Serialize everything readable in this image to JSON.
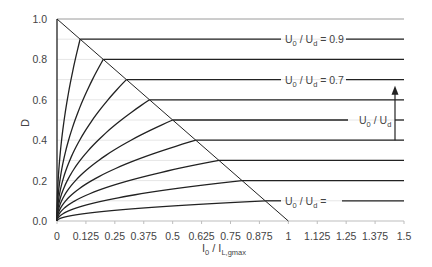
{
  "chart_data": {
    "type": "line",
    "title": "",
    "xlabel": "I0 / IL,gmax",
    "xlabel_parts": {
      "main": "I",
      "sub": "0",
      "sep": " / ",
      "main2": "I",
      "sub2": "L,gmax"
    },
    "ylabel": "D",
    "xlim": [
      0,
      1.5
    ],
    "ylim": [
      0,
      1.0
    ],
    "x_ticks": [
      "0",
      "0.125",
      "0.25",
      "0.375",
      "0.5",
      "0.625",
      "0.75",
      "0.875",
      "1",
      "1.125",
      "1.25",
      "1.375",
      "1.5"
    ],
    "x_tick_values": [
      0,
      0.125,
      0.25,
      0.375,
      0.5,
      0.625,
      0.75,
      0.875,
      1,
      1.125,
      1.25,
      1.375,
      1.5
    ],
    "y_ticks": [
      "0.0",
      "0.2",
      "0.4",
      "0.6",
      "0.8",
      "1.0"
    ],
    "y_tick_values": [
      0,
      0.2,
      0.4,
      0.6,
      0.8,
      1.0
    ],
    "grid": {
      "horizontal": true,
      "step": 0.1,
      "color": "#e6e6e6"
    },
    "boundary_line": {
      "from": [
        0,
        1.0
      ],
      "to": [
        1.0,
        0
      ],
      "description": "CCM/DCM boundary D = 1 - I0/IL,gmax"
    },
    "series": [
      {
        "name": "U0/Ud = 0.9",
        "D": 0.9,
        "knee_x": 0.1
      },
      {
        "name": "U0/Ud = 0.8",
        "D": 0.8,
        "knee_x": 0.2
      },
      {
        "name": "U0/Ud = 0.7",
        "D": 0.7,
        "knee_x": 0.3
      },
      {
        "name": "U0/Ud = 0.6",
        "D": 0.6,
        "knee_x": 0.4
      },
      {
        "name": "U0/Ud = 0.5",
        "D": 0.5,
        "knee_x": 0.5
      },
      {
        "name": "U0/Ud = 0.4",
        "D": 0.4,
        "knee_x": 0.6
      },
      {
        "name": "U0/Ud = 0.3",
        "D": 0.3,
        "knee_x": 0.7
      },
      {
        "name": "U0/Ud = 0.2",
        "D": 0.2,
        "knee_x": 0.8
      },
      {
        "name": "U0/Ud = 0.1",
        "D": 0.1,
        "knee_x": 0.9
      }
    ],
    "annotations": [
      {
        "text_main": "U",
        "text_sub": "0",
        "sep": " / ",
        "text_main2": "U",
        "text_sub2": "d",
        "suffix": " = 0.9",
        "at_D": 0.9,
        "x_px": 283
      },
      {
        "text_main": "U",
        "text_sub": "0",
        "sep": " / ",
        "text_main2": "U",
        "text_sub2": "d",
        "suffix": " = 0.7",
        "at_D": 0.7,
        "x_px": 283
      },
      {
        "text_main": "U",
        "text_sub": "0",
        "sep": " / ",
        "text_main2": "U",
        "text_sub2": "d",
        "suffix": "",
        "at_D": 0.5,
        "x_px": 357
      },
      {
        "text_main": "U",
        "text_sub": "0",
        "sep": " / ",
        "text_main2": "U",
        "text_sub2": "d",
        "suffix": " =",
        "at_D": 0.1,
        "x_px": 283
      }
    ],
    "arrow": {
      "x": 1.46,
      "from_D": 0.4,
      "to_D": 0.66,
      "meaning": "increasing U0/Ud"
    },
    "colors": {
      "curve": "#222222",
      "axis": "#bdbdbd",
      "text": "#444444",
      "top_line": "#9a9a9a"
    }
  }
}
